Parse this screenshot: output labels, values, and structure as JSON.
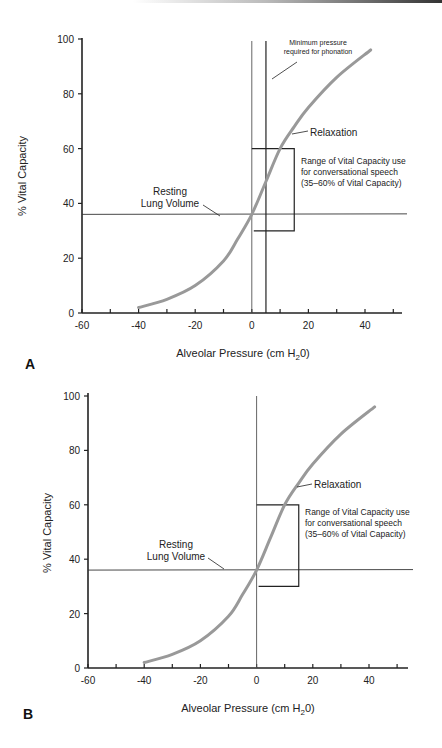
{
  "chart_data": [
    {
      "panel": "A",
      "type": "line",
      "title": "",
      "xlabel": "Alveolar Pressure (cm H2O)",
      "ylabel": "% Vital Capacity",
      "xlim": [
        -60,
        55
      ],
      "ylim": [
        0,
        100
      ],
      "xticks": [
        -60,
        -40,
        -20,
        0,
        20,
        40
      ],
      "yticks": [
        0,
        20,
        40,
        60,
        80,
        100
      ],
      "series": [
        {
          "name": "Relaxation",
          "x": [
            -40,
            -30,
            -20,
            -10,
            -5,
            0,
            5,
            10,
            15,
            20,
            30,
            42
          ],
          "y": [
            2,
            5,
            10,
            19,
            27,
            36,
            48,
            60,
            68,
            75,
            86,
            96
          ]
        }
      ],
      "reference_lines": {
        "resting_lung_volume_y": 36,
        "zero_pressure_x": 0,
        "minimum_phonation_pressure_x": 5
      },
      "speech_range_box": {
        "x0": 0,
        "x1": 15,
        "y0": 30,
        "y1": 60
      },
      "annotations": [
        "Minimum pressure required for phonation",
        "Relaxation",
        "Resting Lung Volume",
        "Range of Vital Capacity use for conversational speech (35–60% of Vital Capacity)"
      ],
      "grid": false
    },
    {
      "panel": "B",
      "type": "line",
      "title": "",
      "xlabel": "Alveolar Pressure (cm H2O)",
      "ylabel": "% Vital Capacity",
      "xlim": [
        -60,
        55
      ],
      "ylim": [
        0,
        100
      ],
      "xticks": [
        -60,
        -40,
        -20,
        0,
        20,
        40
      ],
      "yticks": [
        0,
        20,
        40,
        60,
        80,
        100
      ],
      "series": [
        {
          "name": "Relaxation",
          "x": [
            -40,
            -30,
            -20,
            -10,
            -5,
            0,
            5,
            10,
            15,
            20,
            30,
            42
          ],
          "y": [
            2,
            5,
            10,
            19,
            27,
            36,
            48,
            60,
            68,
            75,
            86,
            96
          ]
        }
      ],
      "reference_lines": {
        "resting_lung_volume_y": 36,
        "zero_pressure_x": 0
      },
      "speech_range_box": {
        "x0": 0,
        "x1": 15,
        "y0": 30,
        "y1": 60
      },
      "annotations": [
        "Relaxation",
        "Resting Lung Volume",
        "Range of Vital Capacity use for conversational speech (35–60% of Vital Capacity)"
      ],
      "grid": false
    }
  ],
  "panels": {
    "A": {
      "label": "A",
      "ylabel": "% Vital Capacity",
      "xlabel_main": "Alveolar Pressure (cm H",
      "xlabel_sub": "2",
      "xlabel_end": "0)",
      "phonation_line1": "Minimum pressure",
      "phonation_line2": "required for phonation",
      "relaxation": "Relaxation",
      "resting1": "Resting",
      "resting2": "Lung Volume",
      "range1": "Range of Vital Capacity use",
      "range2": "for conversational speech",
      "range3": "(35–60% of Vital Capacity)"
    },
    "B": {
      "label": "B",
      "ylabel": "% Vital Capacity",
      "xlabel_main": "Alveolar Pressure (cm H",
      "xlabel_sub": "2",
      "xlabel_end": "0)",
      "relaxation": "Relaxation",
      "resting1": "Resting",
      "resting2": "Lung Volume",
      "range1": "Range of Vital Capacity use",
      "range2": "for conversational speech",
      "range3": "(35–60% of Vital Capacity)"
    }
  },
  "colors": {
    "axis": "#222222",
    "curve": "#999999",
    "text": "#222222"
  }
}
